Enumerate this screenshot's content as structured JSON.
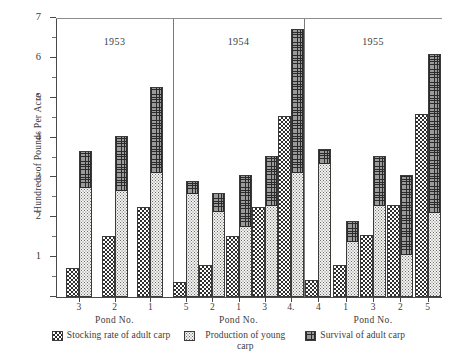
{
  "chart_data": {
    "type": "bar",
    "title": "",
    "subtitle": "",
    "xlabel": "Pond  No.",
    "ylabel": "Hundreds of Pounds Per Acre",
    "ylim": [
      0,
      7
    ],
    "yticks": [
      0,
      1,
      2,
      3,
      4,
      5,
      6,
      7
    ],
    "ytick_labels": [
      "",
      "1",
      "2",
      "3",
      "4",
      "5",
      "6",
      "7"
    ],
    "grid": false,
    "legend_position": "bottom",
    "stacking_note": "Each pond shows two adjacent bars: left bar = stocking rate of adult carp; right bar = production of young carp (lower segment) stacked with survival of adult carp (upper segment).",
    "legend": [
      {
        "key": "stocking",
        "label": "Stocking rate of adult carp",
        "pattern": "checkerboard"
      },
      {
        "key": "production",
        "label": "Production of young carp",
        "pattern": "stipple"
      },
      {
        "key": "survival",
        "label": "Survival of adult carp",
        "pattern": "cross-grid"
      }
    ],
    "panels": [
      {
        "year": "1953",
        "categories": [
          "3",
          "2",
          "1"
        ],
        "series": [
          {
            "name": "Stocking rate of adult carp",
            "values": [
              0.73,
              1.53,
              2.25
            ]
          },
          {
            "name": "Production of young carp",
            "values": [
              2.75,
              2.67,
              3.12
            ]
          },
          {
            "name": "Survival of adult carp",
            "values": [
              0.92,
              1.36,
              2.15
            ]
          }
        ],
        "stacked_totals": [
          3.67,
          4.03,
          5.27
        ]
      },
      {
        "year": "1954",
        "categories": [
          "5",
          "2",
          "1",
          "3",
          "4."
        ],
        "series": [
          {
            "name": "Stocking rate of adult carp",
            "values": [
              0.38,
              0.8,
              1.53,
              2.27,
              4.53
            ]
          },
          {
            "name": "Production of young carp",
            "values": [
              2.6,
              2.15,
              1.75,
              2.3,
              3.12
            ]
          },
          {
            "name": "Survival of adult carp",
            "values": [
              0.3,
              0.45,
              1.3,
              1.23,
              3.6
            ]
          }
        ],
        "stacked_totals": [
          2.9,
          2.6,
          3.05,
          3.53,
          6.72
        ]
      },
      {
        "year": "1955",
        "categories": [
          "4",
          "1",
          "3",
          "2",
          "5"
        ],
        "series": [
          {
            "name": "Stocking rate of adult carp",
            "values": [
              0.42,
              0.8,
              1.55,
              2.3,
              4.6
            ]
          },
          {
            "name": "Production of young carp",
            "values": [
              3.35,
              1.4,
              2.3,
              1.05,
              2.1
            ]
          },
          {
            "name": "Survival of adult carp",
            "values": [
              0.37,
              0.5,
              1.23,
              2.02,
              4.0
            ]
          }
        ],
        "stacked_totals": [
          3.72,
          1.9,
          3.53,
          3.07,
          6.1
        ]
      }
    ]
  }
}
